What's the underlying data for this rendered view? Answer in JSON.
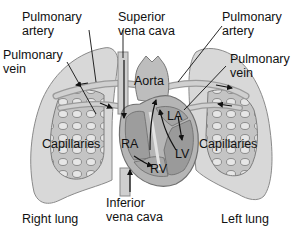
{
  "diagram": {
    "type": "anatomy-pulmonary-circulation",
    "colors": {
      "lung_fill": "#d6d6d6",
      "lung_stroke": "#8a8a8a",
      "capillary_fill": "#bdbdbd",
      "heart_fill": "#b8b8b8",
      "heart_dark": "#8f8f8f",
      "vessel_fill": "#c9c9c9",
      "arrow": "#111111",
      "text": "#111111"
    },
    "labels": {
      "pulmonary_artery_left": {
        "line1": "Pulmonary",
        "line2": "artery"
      },
      "pulmonary_vein_left": {
        "line1": "Pulmonary",
        "line2": "vein"
      },
      "superior_vena_cava": {
        "line1": "Superior",
        "line2": "vena cava"
      },
      "pulmonary_artery_right": {
        "line1": "Pulmonary",
        "line2": "artery"
      },
      "pulmonary_vein_right": {
        "line1": "Pulmonary",
        "line2": "vein"
      },
      "aorta": "Aorta",
      "la": "LA",
      "ra": "RA",
      "lv": "LV",
      "rv": "RV",
      "capillaries_left": "Capillaries",
      "capillaries_right": "Capillaries",
      "inferior_vena_cava": {
        "line1": "Inferior",
        "line2": "vena cava"
      },
      "right_lung": "Right lung",
      "left_lung": "Left lung"
    }
  }
}
